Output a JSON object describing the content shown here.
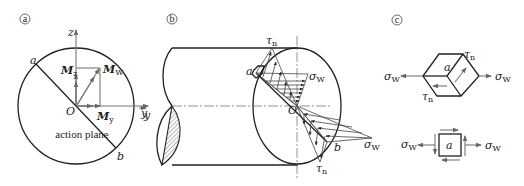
{
  "panels": {
    "a": {
      "marker": "a",
      "axis_z": "z",
      "axis_y": "y",
      "origin": "O",
      "point_a": "a",
      "point_b": "b",
      "mz": {
        "main": "M",
        "sub": "z"
      },
      "my": {
        "main": "M",
        "sub": "y"
      },
      "mw": {
        "main": "M",
        "sub": "W"
      },
      "plane_label": "action plane"
    },
    "b": {
      "marker": "b",
      "axis_y": "y",
      "origin": "O",
      "point_a": "a",
      "point_b": "b",
      "tau_top": {
        "main": "τ",
        "sub": "n"
      },
      "tau_bottom": {
        "main": "τ",
        "sub": "n"
      },
      "sigma_top": {
        "main": "σ",
        "sub": "W"
      },
      "sigma_bottom": {
        "main": "σ",
        "sub": "W"
      }
    },
    "c": {
      "marker": "c",
      "block_label": "a",
      "tau_upper": {
        "main": "τ",
        "sub": "n"
      },
      "tau_lower": {
        "main": "τ",
        "sub": "n"
      },
      "sigma_left": {
        "main": "σ",
        "sub": "W"
      },
      "sigma_right": {
        "main": "σ",
        "sub": "W"
      },
      "square_label": "a",
      "sq_sigma_left": {
        "main": "σ",
        "sub": "W"
      },
      "sq_sigma_right": {
        "main": "σ",
        "sub": "W"
      }
    }
  }
}
